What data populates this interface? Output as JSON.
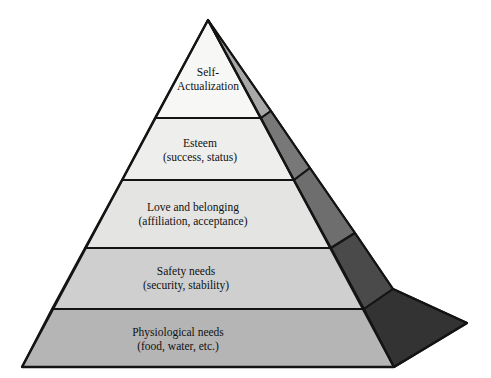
{
  "diagram": {
    "type": "pyramid",
    "shape": "3d-triangular-pyramid",
    "orientation": "apex-top",
    "tier_count": 5,
    "geometry": {
      "apex": [
        208,
        20
      ],
      "base_left": [
        22,
        367
      ],
      "base_front_right": [
        394,
        367
      ],
      "base_back_right": [
        467,
        323
      ],
      "front_divider_y": [
        118,
        180,
        248,
        309
      ]
    },
    "tiers": [
      {
        "index": 1,
        "position": "top",
        "line1": "Self-",
        "line2": "Actualization",
        "front_color": "#f7f7f5",
        "side_color": "#a8a8a8",
        "label_x": 208,
        "label_y": 74,
        "font_size": 11.5
      },
      {
        "index": 2,
        "position": "second",
        "line1": "Esteem",
        "line2": "(success, status)",
        "front_color": "#eeeeec",
        "side_color": "#787878",
        "label_x": 200,
        "label_y": 138,
        "font_size": 11.5
      },
      {
        "index": 3,
        "position": "middle",
        "line1": "Love and belonging",
        "line2": "(affiliation, acceptance)",
        "front_color": "#e4e4e2",
        "side_color": "#6e6e6e",
        "label_x": 193,
        "label_y": 203,
        "font_size": 11.5
      },
      {
        "index": 4,
        "position": "fourth",
        "line1": "Safety needs",
        "line2": "(security, stability)",
        "front_color": "#cfcfcf",
        "side_color": "#4a4a4a",
        "label_x": 186,
        "label_y": 267,
        "font_size": 11.5
      },
      {
        "index": 5,
        "position": "base",
        "line1": "Physiological needs",
        "line2": "(food, water, etc.)",
        "front_color": "#b5b5b5",
        "side_color": "#333333",
        "label_x": 178,
        "label_y": 328,
        "font_size": 11.5
      }
    ],
    "stroke_color": "#141414",
    "background_color": "#ffffff"
  }
}
